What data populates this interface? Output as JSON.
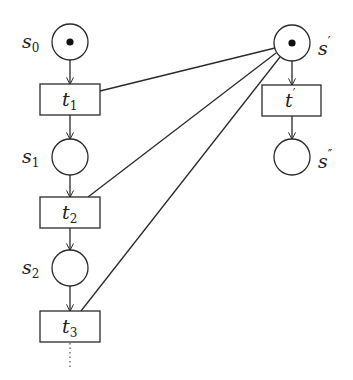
{
  "diagram": {
    "type": "petri-net",
    "places": [
      {
        "id": "s0",
        "base": "s",
        "sub": "0",
        "sup": "",
        "tokens": 1,
        "cx": 70,
        "cy": 42
      },
      {
        "id": "s1",
        "base": "s",
        "sub": "1",
        "sup": "",
        "tokens": 0,
        "cx": 70,
        "cy": 157
      },
      {
        "id": "s2",
        "base": "s",
        "sub": "2",
        "sup": "",
        "tokens": 0,
        "cx": 70,
        "cy": 268
      },
      {
        "id": "s_prime",
        "base": "s",
        "sub": "",
        "sup": "′",
        "tokens": 1,
        "cx": 292,
        "cy": 43
      },
      {
        "id": "s_dprime",
        "base": "s",
        "sub": "",
        "sup": "″",
        "tokens": 0,
        "cx": 292,
        "cy": 157
      }
    ],
    "transitions": [
      {
        "id": "t1",
        "base": "t",
        "sub": "1",
        "sup": ""
      },
      {
        "id": "t2",
        "base": "t",
        "sub": "2",
        "sup": ""
      },
      {
        "id": "t3",
        "base": "t",
        "sub": "3",
        "sup": ""
      },
      {
        "id": "t_prime",
        "base": "t",
        "sub": "",
        "sup": "′"
      }
    ],
    "arcs": [
      {
        "from": "s0",
        "to": "t1",
        "directed": true
      },
      {
        "from": "t1",
        "to": "s1",
        "directed": true
      },
      {
        "from": "s1",
        "to": "t2",
        "directed": true
      },
      {
        "from": "t2",
        "to": "s2",
        "directed": true
      },
      {
        "from": "s2",
        "to": "t3",
        "directed": true
      },
      {
        "from": "s_prime",
        "to": "t_prime",
        "directed": true
      },
      {
        "from": "t_prime",
        "to": "s_dprime",
        "directed": true
      },
      {
        "from": "s_prime",
        "to": "t1",
        "directed": false
      },
      {
        "from": "s_prime",
        "to": "t2",
        "directed": false
      },
      {
        "from": "s_prime",
        "to": "t3",
        "directed": false
      }
    ],
    "continuation": "dotted line below t3 (sequence continues)"
  },
  "labels": {
    "s0": {
      "base": "s",
      "sub": "0"
    },
    "s1": {
      "base": "s",
      "sub": "1"
    },
    "s2": {
      "base": "s",
      "sub": "2"
    },
    "s_prime": {
      "base": "s",
      "sup": "′"
    },
    "s_dprime": {
      "base": "s",
      "sup": "″"
    },
    "t1": {
      "base": "t",
      "sub": "1"
    },
    "t2": {
      "base": "t",
      "sub": "2"
    },
    "t3": {
      "base": "t",
      "sub": "3"
    },
    "t_prime": {
      "base": "t",
      "sup": "′"
    }
  }
}
